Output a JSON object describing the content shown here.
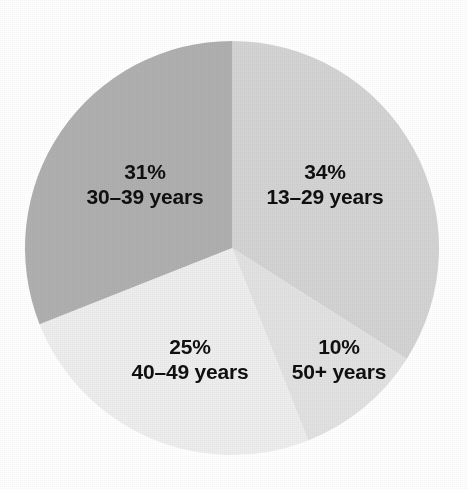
{
  "chart_data": {
    "type": "pie",
    "title": "",
    "subtitle": "",
    "xlabel": "",
    "ylabel": "",
    "legend": "none",
    "grid": false,
    "start_angle_deg": 0,
    "direction": "clockwise",
    "categories": [
      "13–29 years",
      "30–39 years",
      "40–49 years",
      "50+ years"
    ],
    "values": [
      34,
      31,
      25,
      10
    ],
    "units": "percent",
    "total": 100,
    "slices": [
      {
        "id": "slice-13-29",
        "category": "13–29 years",
        "value": 34,
        "percent_label": "34%",
        "color": "#d4d4d4",
        "start_deg": 0,
        "end_deg": 122.4,
        "label_x": 325,
        "label_y": 185
      },
      {
        "id": "slice-50-plus",
        "category": "50+ years",
        "value": 10,
        "percent_label": "10%",
        "color": "#e2e2e2",
        "start_deg": 122.4,
        "end_deg": 158.4,
        "label_x": 339,
        "label_y": 360
      },
      {
        "id": "slice-40-49",
        "category": "40–49 years",
        "value": 25,
        "percent_label": "25%",
        "color": "#eeeeee",
        "start_deg": 158.4,
        "end_deg": 248.4,
        "label_x": 190,
        "label_y": 360
      },
      {
        "id": "slice-30-39",
        "category": "30–39 years",
        "value": 31,
        "percent_label": "31%",
        "color": "#b0b0b0",
        "start_deg": 248.4,
        "end_deg": 360,
        "label_x": 145,
        "label_y": 185
      }
    ],
    "geometry": {
      "center_x": 232,
      "center_y": 248,
      "radius": 207
    },
    "background_color": "#ffffff",
    "label_color": "#101010"
  }
}
